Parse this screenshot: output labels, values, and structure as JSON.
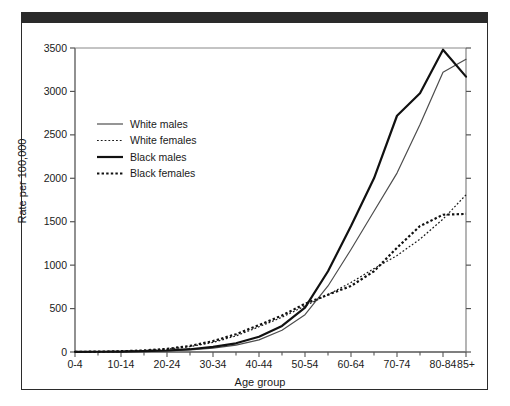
{
  "figure": {
    "background_color": "#ffffff",
    "frame_color": "#2b2b2b",
    "top_bar_color": "#2a2a2a"
  },
  "chart_data": {
    "type": "line",
    "title": "",
    "xlabel": "Age group",
    "ylabel": "Rate per 100,000",
    "categories": [
      "0-4",
      "5-9",
      "10-14",
      "15-19",
      "20-24",
      "25-29",
      "30-34",
      "35-39",
      "40-44",
      "45-49",
      "50-54",
      "55-59",
      "60-64",
      "65-69",
      "70-74",
      "75-79",
      "80-84",
      "85+"
    ],
    "tick_labels_shown": [
      "0-4",
      "10-14",
      "20-24",
      "30-34",
      "40-44",
      "50-54",
      "60-64",
      "70-74",
      "80-84",
      "85+"
    ],
    "ylim": [
      0,
      3500
    ],
    "yticks": [
      0,
      500,
      1000,
      1500,
      2000,
      2500,
      3000,
      3500
    ],
    "ytick_labels": [
      "0",
      "500",
      "1000",
      "1500",
      "2000",
      "2500",
      "3000",
      "3500"
    ],
    "grid": false,
    "legend_position": "upper left",
    "series": [
      {
        "name": "White males",
        "style": "solid",
        "width": "thin",
        "color": "#4d4d4d",
        "values": [
          2,
          3,
          5,
          8,
          14,
          25,
          45,
          80,
          140,
          250,
          430,
          760,
          1180,
          1620,
          2060,
          2620,
          3220,
          3370
        ]
      },
      {
        "name": "White females",
        "style": "dotted",
        "width": "thin",
        "color": "#1a1a1a",
        "values": [
          2,
          4,
          8,
          16,
          32,
          62,
          110,
          185,
          290,
          400,
          530,
          660,
          800,
          960,
          1110,
          1300,
          1530,
          1810
        ]
      },
      {
        "name": "Black males",
        "style": "solid",
        "width": "thick",
        "color": "#111111",
        "values": [
          2,
          3,
          5,
          9,
          17,
          32,
          58,
          100,
          175,
          300,
          510,
          930,
          1450,
          2000,
          2720,
          2980,
          3480,
          3170
        ]
      },
      {
        "name": "Black females",
        "style": "dotted",
        "width": "thick",
        "color": "#111111",
        "values": [
          2,
          4,
          9,
          18,
          36,
          70,
          125,
          205,
          310,
          420,
          555,
          660,
          760,
          930,
          1200,
          1450,
          1580,
          1590
        ]
      }
    ]
  }
}
